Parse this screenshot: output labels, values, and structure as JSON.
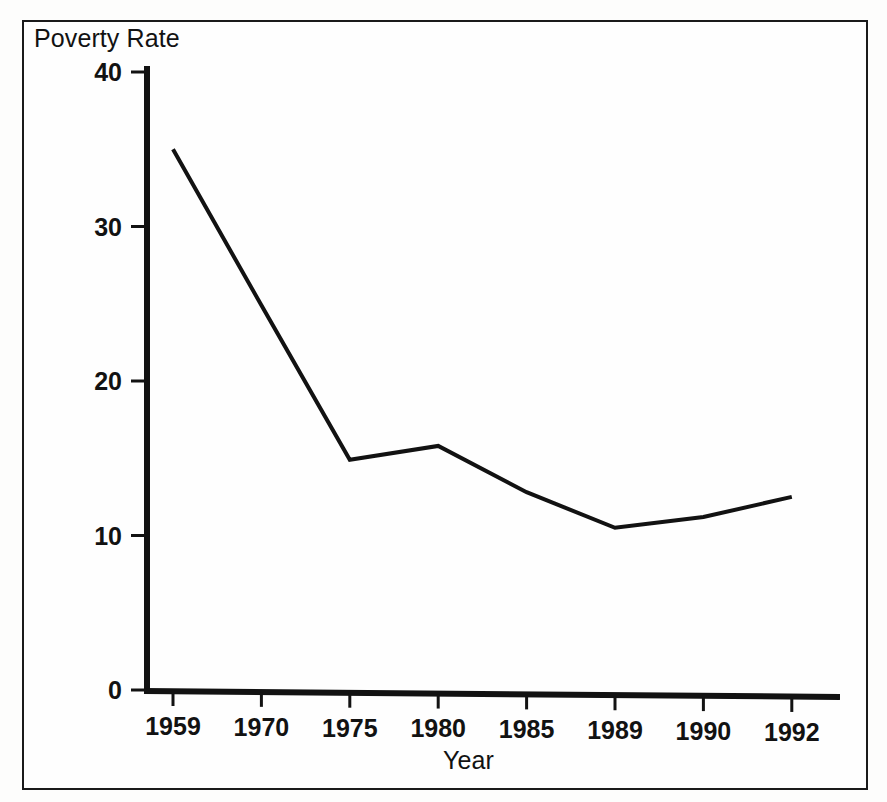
{
  "figure": {
    "background_color": "#fefefe",
    "ink_color": "#121212",
    "frame": {
      "visible": true,
      "border_color": "#1a1a1a"
    }
  },
  "chart_data": {
    "type": "line",
    "title": "",
    "xlabel": "Year",
    "ylabel": "Poverty Rate",
    "categories": [
      "1959",
      "1970",
      "1975",
      "1980",
      "1985",
      "1989",
      "1990",
      "1992"
    ],
    "x": [
      1959,
      1970,
      1975,
      1980,
      1985,
      1989,
      1990,
      1992
    ],
    "values": [
      35.0,
      24.9,
      14.9,
      15.8,
      12.8,
      10.5,
      11.2,
      12.5
    ],
    "series": [
      {
        "name": "Poverty Rate",
        "values": [
          35.0,
          24.9,
          14.9,
          15.8,
          12.8,
          10.5,
          11.2,
          12.5
        ],
        "color": "#121212",
        "line_width": 4
      }
    ],
    "yticks": [
      0,
      10,
      20,
      30,
      40
    ],
    "ytick_labels": [
      "0",
      "10",
      "20",
      "30",
      "40"
    ],
    "xtick_labels": [
      "1959",
      "1970",
      "1975",
      "1980",
      "1985",
      "1989",
      "1990",
      "1992"
    ],
    "ylim": [
      0,
      41
    ],
    "grid": false,
    "legend": null,
    "markers": false
  }
}
